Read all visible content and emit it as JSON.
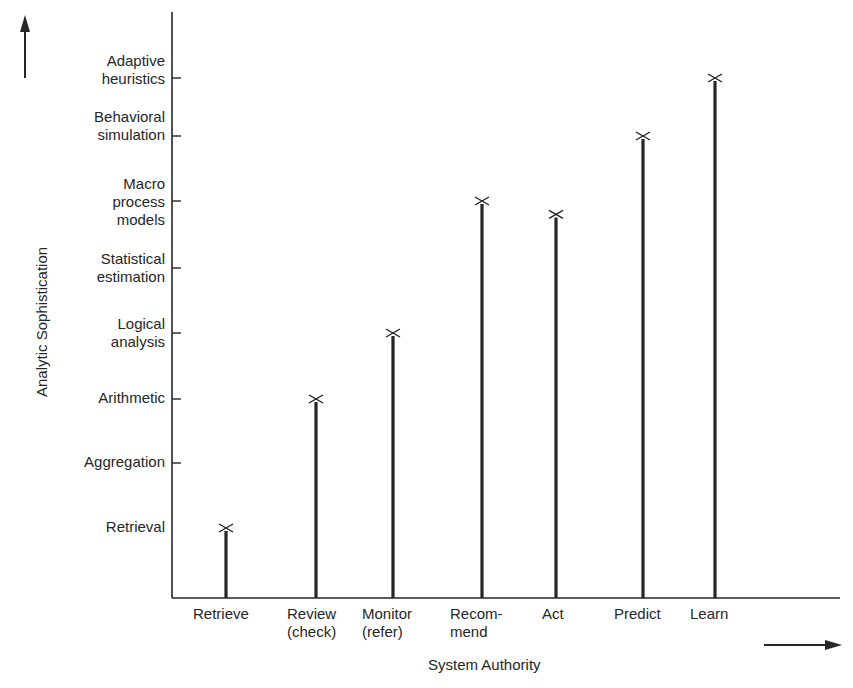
{
  "chart_data": {
    "type": "bar",
    "style": "stick (lollipop) bars with X markers at top",
    "title": "",
    "xlabel": "System Authority",
    "ylabel": "Analytic Sophistication",
    "categories": [
      "Retrieve",
      "Review\n(check)",
      "Monitor\n(refer)",
      "Recom-\nmend",
      "Act",
      "Predict",
      "Learn"
    ],
    "y_levels": [
      "Retrieval",
      "Aggregation",
      "Arithmetic",
      "Logical\nanalysis",
      "Statistical\nestimation",
      "Macro\nprocess\nmodels",
      "Behavioral\nsimulation",
      "Adaptive\nheuristics"
    ],
    "values": [
      1,
      3,
      4,
      6,
      5.8,
      7,
      8.05
    ],
    "value_labels": [
      "Retrieval",
      "Arithmetic",
      "Logical analysis",
      "Macro process models",
      "Just below Macro process models",
      "Behavioral simulation",
      "Adaptive heuristics"
    ],
    "ylim": [
      0,
      8.8
    ],
    "grid": false,
    "legend": null,
    "annotations": [
      "upward arrow beside y-axis",
      "rightward arrow beside x-axis"
    ]
  },
  "colors": {
    "ink": "#262626",
    "background": "#ffffff"
  }
}
